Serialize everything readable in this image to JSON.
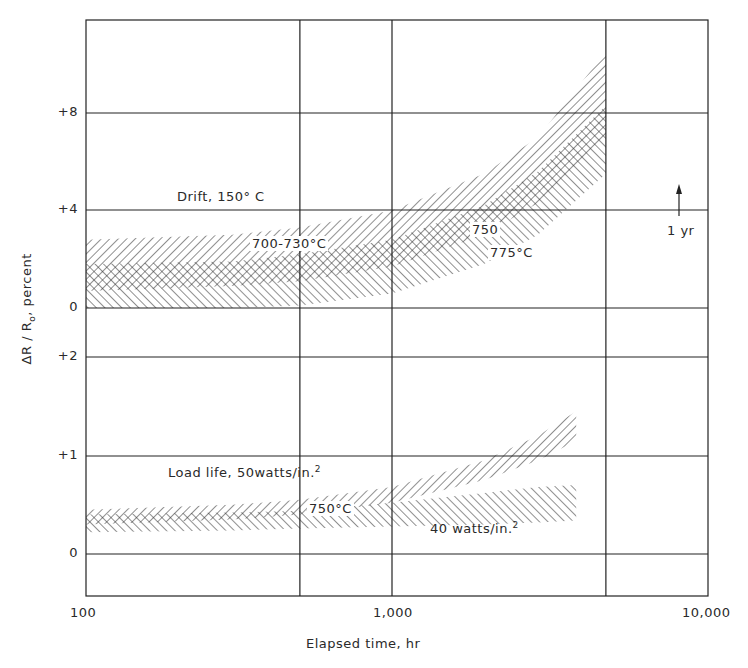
{
  "chart_data": {
    "type": "area",
    "title": "",
    "xlabel": "Elapsed time, hr",
    "ylabel": "ΔR / R₀, percent",
    "x_scale": "log",
    "xlim": [
      100,
      10000
    ],
    "x_ticks": [
      "100",
      "1,000",
      "10,000"
    ],
    "panels": [
      {
        "name": "Drift, 150° C",
        "y_ticks": [
          "0",
          "+4",
          "+8"
        ],
        "ylim": [
          0,
          11.5
        ],
        "series": [
          {
            "name": "700-730°C",
            "hatch": "backslash",
            "x": [
              100,
              300,
              500,
              1000,
              2000,
              3000,
              5000
            ],
            "lower": [
              0.7,
              0.9,
              1.1,
              1.7,
              3.0,
              4.3,
              7.0
            ],
            "upper": [
              2.8,
              3.0,
              3.3,
              4.0,
              5.5,
              7.0,
              10.5
            ]
          },
          {
            "name": "750-775°C",
            "hatch": "slash",
            "x": [
              100,
              300,
              500,
              1000,
              2000,
              3000,
              5000
            ],
            "lower": [
              0.0,
              0.0,
              0.1,
              0.6,
              1.8,
              3.0,
              5.5
            ],
            "upper": [
              1.8,
              1.9,
              2.2,
              2.8,
              4.2,
              5.6,
              8.3
            ]
          }
        ],
        "annotations": [
          "Drift, 150° C",
          "700-730°C",
          "750",
          "775°C",
          "1 yr"
        ]
      },
      {
        "name": "Load life",
        "y_ticks": [
          "0",
          "+1",
          "+2"
        ],
        "ylim": [
          -0.4,
          2.2
        ],
        "series": [
          {
            "name": "50 watts/in.² (750°C)",
            "hatch": "backslash",
            "x": [
              100,
              300,
              500,
              1000,
              2000,
              3000,
              4000
            ],
            "lower": [
              0.3,
              0.35,
              0.4,
              0.52,
              0.75,
              0.95,
              1.15
            ],
            "upper": [
              0.45,
              0.5,
              0.55,
              0.68,
              0.95,
              1.2,
              1.45
            ]
          },
          {
            "name": "40 watts/in.²",
            "hatch": "slash",
            "x": [
              100,
              300,
              500,
              1000,
              2000,
              3000,
              4000
            ],
            "lower": [
              0.22,
              0.24,
              0.26,
              0.28,
              0.3,
              0.32,
              0.34
            ],
            "upper": [
              0.4,
              0.42,
              0.44,
              0.52,
              0.62,
              0.68,
              0.7
            ]
          }
        ],
        "annotations": [
          "Load life, 50watts/in.²",
          "750°C",
          "40 watts/in.²"
        ]
      }
    ],
    "grid": true,
    "reference_marker": {
      "label": "1 yr",
      "x": 8760
    }
  },
  "labels": {
    "y_ticks_upper": [
      "+8",
      "+4",
      "0"
    ],
    "y_ticks_lower": [
      "+2",
      "+1",
      "0"
    ],
    "x_ticks": [
      "100",
      "1,000",
      "10,000"
    ],
    "xlabel": "Elapsed time, hr",
    "ylabel_main": "ΔR / R",
    "ylabel_sub": "o",
    "ylabel_tail": ", percent",
    "drift": "Drift, 150° C",
    "band_a": "700-730°C",
    "band_b1": "750",
    "band_b2": "775°C",
    "one_year": "1 yr",
    "load_life": "Load life, 50watts/in.",
    "load_life_sup": "2",
    "load_750": "750°C",
    "w40": "40 watts/in.",
    "w40_sup": "2"
  }
}
